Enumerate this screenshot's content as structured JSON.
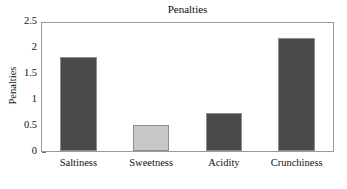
{
  "chart_data": {
    "type": "bar",
    "title": "Penalties",
    "xlabel": "",
    "ylabel": "Penalties",
    "categories": [
      "Saltiness",
      "Sweetness",
      "Acidity",
      "Crunchiness"
    ],
    "values": [
      1.83,
      0.5,
      0.75,
      2.2
    ],
    "series": [
      {
        "name": "Penalties",
        "values": [
          1.83,
          0.5,
          0.75,
          2.2
        ]
      }
    ],
    "bar_colors": [
      "#4a4a4a",
      "#c8c8c8",
      "#4a4a4a",
      "#4a4a4a"
    ],
    "ylim": [
      0,
      2.5
    ],
    "y_ticks": [
      "0",
      "0.5",
      "1",
      "1.5",
      "2",
      "2.5"
    ],
    "y_tick_values": [
      0,
      0.5,
      1,
      1.5,
      2,
      2.5
    ],
    "grid": false,
    "legend": "none",
    "frame": true,
    "colors": {
      "bar_dark": "#4a4a4a",
      "bar_light": "#c8c8c8",
      "bar_edge": "#8f8f8f",
      "axis": "#9a9a9a",
      "text": "#111111",
      "background": "#ffffff"
    }
  }
}
